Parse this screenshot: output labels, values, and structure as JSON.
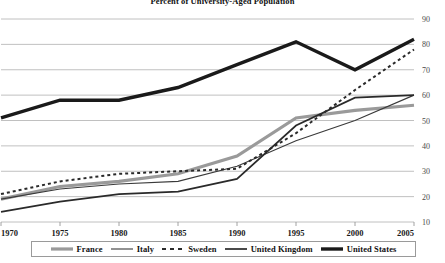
{
  "chart_data": {
    "type": "line",
    "title": "Percent of University-Aged Population",
    "xlabel": "",
    "ylabel": "",
    "xlim": [
      1970,
      2005
    ],
    "ylim": [
      10,
      90
    ],
    "grid": true,
    "legend_position": "bottom",
    "x": [
      1970,
      1975,
      1980,
      1985,
      1990,
      1995,
      2000,
      2005
    ],
    "xticks": [
      "1970",
      "1975",
      "1980",
      "1985",
      "1990",
      "1995",
      "2000",
      "2005"
    ],
    "yticks": [
      "10",
      "20",
      "30",
      "40",
      "50",
      "60",
      "70",
      "80",
      "90"
    ],
    "series": [
      {
        "name": "France",
        "style": "solid-thick-gray",
        "color": "#9a9a9a",
        "width": 3.2,
        "dash": "",
        "values": [
          19,
          24,
          26,
          29,
          36,
          51,
          54,
          56
        ]
      },
      {
        "name": "Italy",
        "style": "solid-thin-black",
        "color": "#3a3a3a",
        "width": 1.1,
        "dash": "",
        "values": [
          19,
          23,
          25,
          26,
          32,
          42,
          50,
          60
        ]
      },
      {
        "name": "Sweden",
        "style": "dashed-black",
        "color": "#2a2a2a",
        "width": 2.0,
        "dash": "3,3",
        "values": [
          21,
          26,
          29,
          30,
          31,
          45,
          62,
          78
        ]
      },
      {
        "name": "United Kingdom",
        "style": "solid-medium-black",
        "color": "#2a2a2a",
        "width": 1.7,
        "dash": "",
        "values": [
          14,
          18,
          21,
          22,
          27,
          48,
          59,
          60
        ]
      },
      {
        "name": "United States",
        "style": "solid-extrathick-black",
        "color": "#1a1a1a",
        "width": 3.4,
        "dash": "",
        "values": [
          51,
          58,
          58,
          63,
          72,
          81,
          70,
          82
        ]
      }
    ]
  },
  "legend": {
    "items": [
      {
        "label": "France"
      },
      {
        "label": "Italy"
      },
      {
        "label": "Sweden"
      },
      {
        "label": "United Kingdom"
      },
      {
        "label": "United States"
      }
    ]
  }
}
